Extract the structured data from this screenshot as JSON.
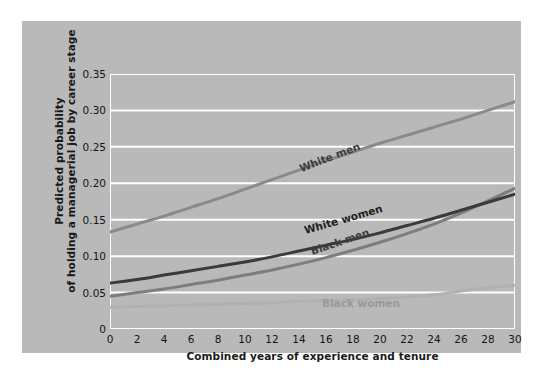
{
  "figure": {
    "background": "#ffffff",
    "panel_color": "#b9b9b9",
    "gridline_color": "#ffffff"
  },
  "chart_data": {
    "type": "line",
    "title": "",
    "xlabel": "Combined years of experience and tenure",
    "ylabel": "Predicted probability of holding a managerial job by career stage",
    "ylabel_line1": "Predicted probability",
    "ylabel_line2": "of holding a managerial job by career stage",
    "xlim": [
      0,
      30
    ],
    "ylim": [
      0,
      0.35
    ],
    "xticks": [
      0,
      2,
      4,
      6,
      8,
      10,
      12,
      14,
      16,
      18,
      20,
      22,
      24,
      26,
      28,
      30
    ],
    "xtick_labels": [
      "0",
      "2",
      "4",
      "6",
      "8",
      "10",
      "12",
      "14",
      "16",
      "18",
      "20",
      "22",
      "24",
      "26",
      "28",
      "30"
    ],
    "yticks": [
      0,
      0.05,
      0.1,
      0.15,
      0.2,
      0.25,
      0.3,
      0.35
    ],
    "ytick_labels": [
      "0",
      "0.05",
      "0.10",
      "0.15",
      "0.20",
      "0.25",
      "0.30",
      "0.35"
    ],
    "grid": "horizontal",
    "legend": "inline-labels",
    "x": [
      0,
      2,
      4,
      6,
      8,
      10,
      12,
      14,
      16,
      18,
      20,
      22,
      24,
      26,
      28,
      30
    ],
    "series": [
      {
        "name": "White men",
        "color": "#8a8a8a",
        "label_x": 14.2,
        "label_y": 0.213,
        "label_rotation": -21,
        "label_color": "#3c3c3c",
        "values": [
          0.133,
          0.144,
          0.155,
          0.167,
          0.179,
          0.192,
          0.205,
          0.218,
          0.231,
          0.243,
          0.255,
          0.266,
          0.277,
          0.288,
          0.3,
          0.312
        ]
      },
      {
        "name": "White women",
        "color": "#3a3a3a",
        "label_x": 14.5,
        "label_y": 0.127,
        "label_rotation": -16,
        "label_color": "#1e1e1e",
        "values": [
          0.063,
          0.068,
          0.074,
          0.08,
          0.086,
          0.092,
          0.099,
          0.107,
          0.115,
          0.123,
          0.132,
          0.142,
          0.152,
          0.163,
          0.174,
          0.185
        ]
      },
      {
        "name": "Black men",
        "color": "#7d7d7d",
        "label_x": 15.0,
        "label_y": 0.099,
        "label_rotation": -19,
        "label_color": "#3c3c3c",
        "values": [
          0.045,
          0.05,
          0.055,
          0.061,
          0.067,
          0.074,
          0.081,
          0.089,
          0.098,
          0.108,
          0.119,
          0.131,
          0.144,
          0.159,
          0.176,
          0.193
        ]
      },
      {
        "name": "Black women",
        "color": "#b0b0b0",
        "label_x": 15.7,
        "label_y": 0.027,
        "label_rotation": 0,
        "label_color": "#989898",
        "values": [
          0.03,
          0.031,
          0.032,
          0.033,
          0.034,
          0.035,
          0.036,
          0.038,
          0.039,
          0.04,
          0.042,
          0.044,
          0.047,
          0.052,
          0.057,
          0.06
        ]
      }
    ]
  }
}
